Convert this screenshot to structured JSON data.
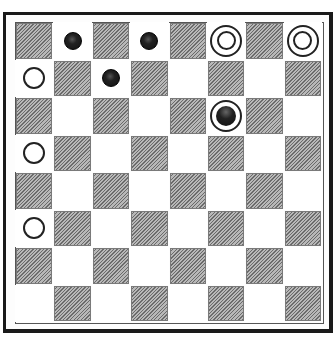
{
  "board": {
    "rows": 8,
    "cols": 8,
    "dark_square_parity": "even",
    "colors": {
      "dark_square": "#9a9a9a",
      "light_square": "#ffffff",
      "border": "#1a1a1a",
      "black_piece": "#111111",
      "white_piece": "#ffffff"
    },
    "pieces": [
      {
        "row": 0,
        "col": 1,
        "type": "man",
        "color": "black"
      },
      {
        "row": 0,
        "col": 3,
        "type": "man",
        "color": "black"
      },
      {
        "row": 0,
        "col": 5,
        "type": "king",
        "color": "white"
      },
      {
        "row": 0,
        "col": 7,
        "type": "king",
        "color": "white"
      },
      {
        "row": 1,
        "col": 0,
        "type": "man",
        "color": "white"
      },
      {
        "row": 1,
        "col": 2,
        "type": "man",
        "color": "black"
      },
      {
        "row": 2,
        "col": 5,
        "type": "king",
        "color": "black"
      },
      {
        "row": 3,
        "col": 0,
        "type": "man",
        "color": "white"
      },
      {
        "row": 5,
        "col": 0,
        "type": "man",
        "color": "white"
      }
    ]
  }
}
